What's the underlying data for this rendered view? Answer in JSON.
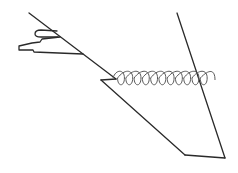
{
  "diagram": {
    "elements": [
      {
        "id": "incline-upper",
        "kind": "line"
      },
      {
        "id": "notch",
        "kind": "line"
      },
      {
        "id": "incline-lower",
        "kind": "line"
      },
      {
        "id": "base",
        "kind": "line"
      },
      {
        "id": "right-slant",
        "kind": "line"
      },
      {
        "id": "spring",
        "kind": "coil",
        "turns": 11
      },
      {
        "id": "upper-tab",
        "kind": "shape"
      },
      {
        "id": "lower-block",
        "kind": "shape"
      }
    ],
    "colors": {
      "stroke": "#2a2a2a",
      "spring": "#5a5a5a",
      "background": "#ffffff"
    }
  }
}
